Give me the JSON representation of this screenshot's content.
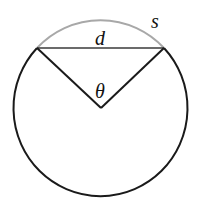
{
  "diagram": {
    "labels": {
      "arc": "s",
      "chord": "d",
      "angle": "θ"
    },
    "colors": {
      "circle": "#1a1a1a",
      "arc": "#a8a8a8",
      "chord": "#3a3a3a",
      "radii": "#1a1a1a",
      "background": "#ffffff"
    },
    "geometry": {
      "center": [
        100,
        107
      ],
      "radius": 87,
      "chord_left": [
        37,
        48
      ],
      "chord_right": [
        164,
        48
      ]
    }
  }
}
